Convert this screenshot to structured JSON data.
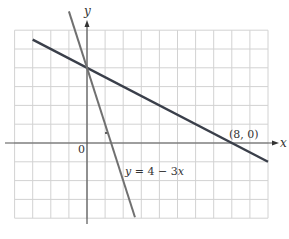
{
  "chart_data": {
    "type": "line",
    "title": "",
    "xlabel": "x",
    "ylabel": "y",
    "xlim": [
      -4,
      10
    ],
    "ylim": [
      -4,
      6
    ],
    "grid": true,
    "grid_step": 1,
    "origin_label": "0",
    "series": [
      {
        "name": "line-1",
        "equation": "y = 4 - x/2",
        "x": [
          -3,
          10
        ],
        "y": [
          5.5,
          -1
        ],
        "color": "#3a3f4a"
      },
      {
        "name": "y = 4 - 3x",
        "equation": "y = 4 - 3x",
        "x": [
          -1,
          2.65
        ],
        "y": [
          7,
          -3.95
        ],
        "color": "#707070"
      }
    ],
    "annotations": [
      {
        "text": "(8, 0)",
        "x": 8,
        "y": 0
      },
      {
        "text": "y = 4 − 3x",
        "x": 2.1,
        "y": -1.5
      }
    ]
  },
  "labels": {
    "x_axis": "x",
    "y_axis": "y",
    "origin": "0",
    "intercept": "(8, 0)",
    "eq_y": "y",
    "eq_rest": " = 4 − 3",
    "eq_x": "x"
  },
  "colors": {
    "grid": "#d2d2d2",
    "axis": "#555555",
    "line1": "#3a3f4a",
    "line2": "#707070"
  }
}
